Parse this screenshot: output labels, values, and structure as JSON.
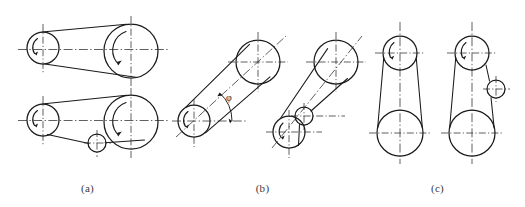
{
  "figure": {
    "background_color": "#ffffff",
    "line_color": "#1a1a1a",
    "centerline_color": "#2b2b2b",
    "captions": [
      {
        "id": "a",
        "label": "(a)"
      },
      {
        "id": "b",
        "label": "(b)"
      },
      {
        "id": "c",
        "label": "(c)"
      }
    ],
    "annotations": [
      {
        "name": "inclination-angle",
        "symbol": "φ",
        "group": "b"
      }
    ],
    "groups": [
      {
        "id": "a",
        "label": "(a)",
        "orientation": "horizontal",
        "arrangements": [
          {
            "name": "horizontal-drive-plain",
            "idler": false,
            "pulleys": [
              {
                "role": "driving-small-pulley",
                "cx": 43,
                "cy": 48,
                "r": 16
              },
              {
                "role": "driven-large-pulley",
                "cx": 131,
                "cy": 51,
                "r": 27
              }
            ]
          },
          {
            "name": "horizontal-drive-with-idler",
            "idler": true,
            "pulleys": [
              {
                "role": "driving-small-pulley",
                "cx": 43,
                "cy": 120,
                "r": 16
              },
              {
                "role": "driven-large-pulley",
                "cx": 131,
                "cy": 122,
                "r": 27
              },
              {
                "role": "idler-pulley",
                "cx": 97,
                "cy": 143,
                "r": 9
              }
            ]
          }
        ]
      },
      {
        "id": "b",
        "label": "(b)",
        "orientation": "inclined",
        "arrangements": [
          {
            "name": "inclined-drive-plain",
            "idler": false,
            "pulleys": [
              {
                "role": "driving-small-pulley",
                "cx": 194,
                "cy": 121,
                "r": 16
              },
              {
                "role": "driven-large-pulley",
                "cx": 258,
                "cy": 62,
                "r": 22
              }
            ]
          },
          {
            "name": "inclined-drive-with-idler",
            "idler": true,
            "pulleys": [
              {
                "role": "driving-small-pulley",
                "cx": 289,
                "cy": 132,
                "r": 16
              },
              {
                "role": "driven-large-pulley",
                "cx": 336,
                "cy": 62,
                "r": 22
              },
              {
                "role": "idler-pulley",
                "cx": 304,
                "cy": 116,
                "r": 9
              }
            ]
          }
        ]
      },
      {
        "id": "c",
        "label": "(c)",
        "orientation": "vertical",
        "arrangements": [
          {
            "name": "vertical-drive-plain",
            "idler": false,
            "pulleys": [
              {
                "role": "driving-small-pulley",
                "cx": 400,
                "cy": 53,
                "r": 17
              },
              {
                "role": "driven-large-pulley",
                "cx": 400,
                "cy": 133,
                "r": 23
              }
            ]
          },
          {
            "name": "vertical-drive-with-idler",
            "idler": true,
            "pulleys": [
              {
                "role": "driving-small-pulley",
                "cx": 472,
                "cy": 53,
                "r": 17
              },
              {
                "role": "driven-large-pulley",
                "cx": 472,
                "cy": 133,
                "r": 23
              },
              {
                "role": "idler-pulley",
                "cx": 496,
                "cy": 89,
                "r": 9
              }
            ]
          }
        ]
      }
    ]
  }
}
